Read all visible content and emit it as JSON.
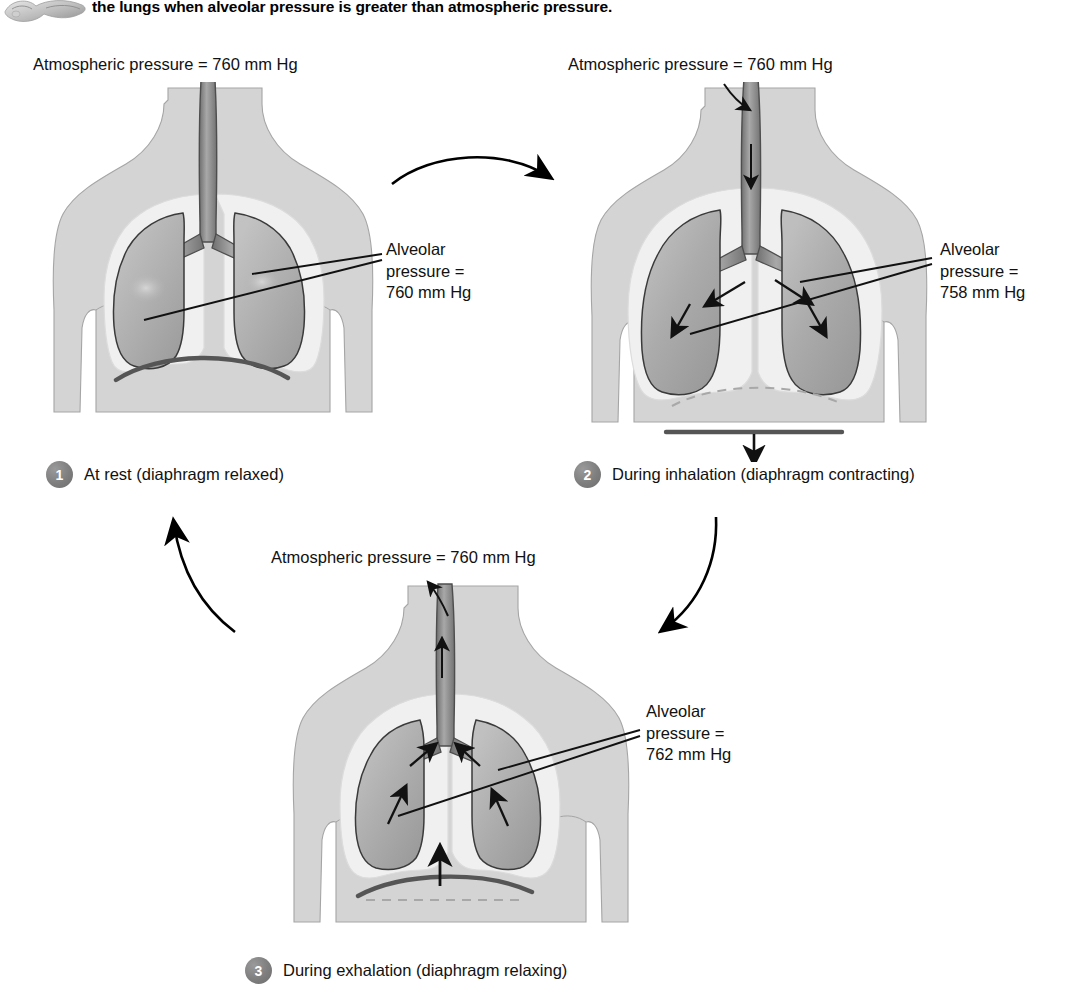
{
  "header": {
    "clipped_line": "increases the volume of the thoracic cavity. Air leaves",
    "line_1": "the lungs when alveolar pressure is greater than atmospheric pressure.",
    "thumb_icon": "lungs-thumbnail-icon"
  },
  "panels": [
    {
      "id": "at-rest",
      "step_number": "1",
      "caption": "At rest (diaphragm relaxed)",
      "atmospheric_label": "Atmospheric pressure = 760 mm Hg",
      "alveolar_label_lines": [
        "Alveolar",
        "pressure =",
        "760 mm Hg"
      ],
      "alveolar_value": "760 mm Hg",
      "diaphragm_state": "relaxed-domed",
      "airflow": "none"
    },
    {
      "id": "during-inhalation",
      "step_number": "2",
      "caption": "During inhalation (diaphragm contracting)",
      "atmospheric_label": "Atmospheric pressure = 760 mm Hg",
      "alveolar_label_lines": [
        "Alveolar",
        "pressure =",
        "758 mm Hg"
      ],
      "alveolar_value": "758 mm Hg",
      "diaphragm_state": "contracted-flattened",
      "airflow": "inward"
    },
    {
      "id": "during-exhalation",
      "step_number": "3",
      "caption": "During exhalation (diaphragm relaxing)",
      "atmospheric_label": "Atmospheric pressure = 760 mm Hg",
      "alveolar_label_lines": [
        "Alveolar",
        "pressure =",
        "762 mm Hg"
      ],
      "alveolar_value": "762 mm Hg",
      "diaphragm_state": "relaxing-rising",
      "airflow": "outward"
    }
  ],
  "cycle_arrows": [
    {
      "name": "arrow-rest-to-inhalation",
      "from": "1",
      "to": "2"
    },
    {
      "name": "arrow-inhalation-to-exhalation",
      "from": "2",
      "to": "3"
    },
    {
      "name": "arrow-exhalation-to-rest",
      "from": "3",
      "to": "1"
    }
  ],
  "colors": {
    "body_fill": "#d4d4d4",
    "body_stroke": "#9a9a9a",
    "pleura_fill": "#efefef",
    "lung_fill": "#b0b0b0",
    "lung_stroke": "#3a3a3a",
    "airway_fill": "#9c9c9c",
    "airway_stroke": "#4a4a4a",
    "diaphragm": "#555555",
    "diaphragm_dashed": "#9a9a9a",
    "arrow": "#000000",
    "badge": "#7e7e7e",
    "text": "#111111"
  }
}
